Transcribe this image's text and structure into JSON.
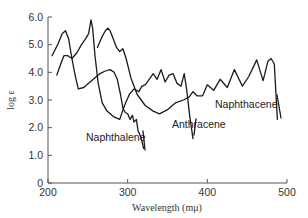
{
  "chart_data": {
    "type": "line",
    "title": "",
    "xlabel": "Wavelength (mμ)",
    "ylabel": "log ε",
    "xlim": [
      200,
      500
    ],
    "ylim": [
      0,
      6.0
    ],
    "xticks": [
      200,
      300,
      400,
      500
    ],
    "yticks": [
      0,
      1.0,
      2.0,
      3.0,
      4.0,
      5.0,
      6.0
    ],
    "xtick_labels": [
      "200",
      "300",
      "400",
      "500"
    ],
    "ytick_labels": [
      "0",
      "1.0",
      "2.0",
      "3.0",
      "4.0",
      "5.0",
      "6.0"
    ],
    "grid": false,
    "legend": "none (inline labels)",
    "series": [
      {
        "name": "Naphthalene",
        "x": [
          205,
          212,
          218,
          222,
          226,
          230,
          234,
          238,
          245,
          255,
          265,
          272,
          278,
          283,
          287,
          291,
          294,
          297,
          300,
          303,
          306,
          308,
          311,
          313,
          316,
          318,
          320
        ],
        "y": [
          4.6,
          5.0,
          5.4,
          5.5,
          5.2,
          4.5,
          3.9,
          3.4,
          3.45,
          3.7,
          3.95,
          4.05,
          4.1,
          4.0,
          3.75,
          3.2,
          2.7,
          2.55,
          2.5,
          2.3,
          2.45,
          2.2,
          2.3,
          1.9,
          1.7,
          1.5,
          1.25
        ]
      },
      {
        "name": "Anthracene",
        "x": [
          211,
          216,
          220,
          225,
          230,
          236,
          242,
          247,
          251,
          254,
          256,
          259,
          263,
          268,
          274,
          282,
          290,
          296,
          302,
          308,
          314,
          318,
          322,
          327,
          332,
          337,
          342,
          347,
          352,
          357,
          362,
          367,
          371,
          374,
          378,
          382
        ],
        "y": [
          3.9,
          4.3,
          4.6,
          4.6,
          4.5,
          4.7,
          5.0,
          5.2,
          5.4,
          5.9,
          5.6,
          4.6,
          3.6,
          2.9,
          2.6,
          2.4,
          2.3,
          2.8,
          3.2,
          3.4,
          3.3,
          3.5,
          3.55,
          3.75,
          3.95,
          3.75,
          4.1,
          3.65,
          3.9,
          3.95,
          3.6,
          3.5,
          3.95,
          3.4,
          2.4,
          1.6
        ]
      },
      {
        "name": "Naphthacene",
        "x": [
          262,
          268,
          272,
          275,
          278,
          282,
          286,
          290,
          294,
          298,
          304,
          312,
          322,
          332,
          340,
          350,
          360,
          370,
          377,
          382,
          387,
          394,
          400,
          408,
          416,
          425,
          434,
          444,
          452,
          462,
          470,
          476,
          480,
          484,
          488
        ],
        "y": [
          4.9,
          5.3,
          5.5,
          5.6,
          5.5,
          5.2,
          4.9,
          4.75,
          4.85,
          4.5,
          3.8,
          3.2,
          2.8,
          2.6,
          2.5,
          2.65,
          2.9,
          3.0,
          3.1,
          3.3,
          3.15,
          3.15,
          3.55,
          3.35,
          3.75,
          3.45,
          4.1,
          3.5,
          3.85,
          4.45,
          3.7,
          4.4,
          4.5,
          4.3,
          2.3
        ]
      }
    ],
    "annotations": [
      {
        "text": "Naphthalene",
        "x": 272,
        "y": 1.6
      },
      {
        "text": "Anthracene",
        "x": 370,
        "y": 2.1
      },
      {
        "text": "Naphthacene",
        "x": 445,
        "y": 2.7
      }
    ]
  },
  "labels": {
    "x_axis": "Wavelength (mμ)",
    "y_axis": "log ε",
    "naphthalene": "Naphthalene",
    "anthracene": "Anthracene",
    "naphthacene": "Naphthacene"
  }
}
